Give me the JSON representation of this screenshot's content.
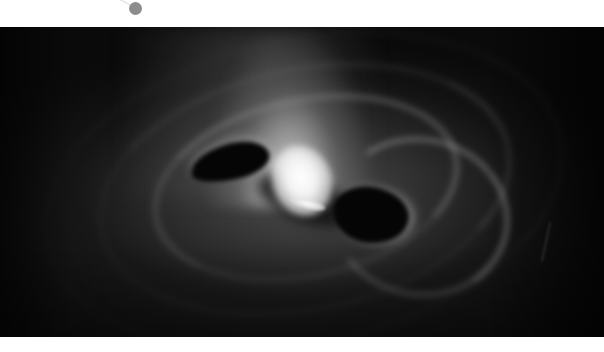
{
  "image": {
    "alt": "Grayscale rendering of a swirling accretion disk around two dark shadow lobes with a bright central core and a vertical jet plume",
    "colors": {
      "background": "#ffffff",
      "frame_dark": "#0a0a0a",
      "core": "#ffffff",
      "marker_dot": "#8c8c8c"
    }
  },
  "marker": {
    "icon": "dot-marker"
  }
}
